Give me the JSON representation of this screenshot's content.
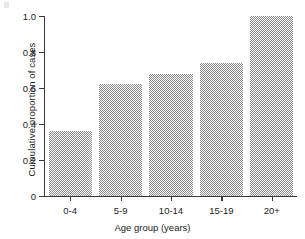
{
  "chart_data": {
    "type": "bar",
    "title": "",
    "xlabel": "Age group (years)",
    "ylabel": "Cumulative proportion of cases",
    "categories": [
      "0-4",
      "5-9",
      "10-14",
      "15-19",
      "20+"
    ],
    "values": [
      0.36,
      0.62,
      0.68,
      0.74,
      1.0
    ],
    "ylim": [
      0,
      1.0
    ],
    "yticks": [
      0,
      0.2,
      0.4,
      0.6,
      0.8,
      1.0
    ],
    "ytick_labels": [
      "0",
      "0.2",
      "0.4",
      "0.6",
      "0.8",
      "1.0"
    ],
    "grid": false,
    "legend": null,
    "series": [
      {
        "name": "Cumulative proportion of cases",
        "values": [
          0.36,
          0.62,
          0.68,
          0.74,
          1.0
        ]
      }
    ],
    "bar_fill": "#8a8a8a",
    "axis_color": "#3a3a3a"
  }
}
